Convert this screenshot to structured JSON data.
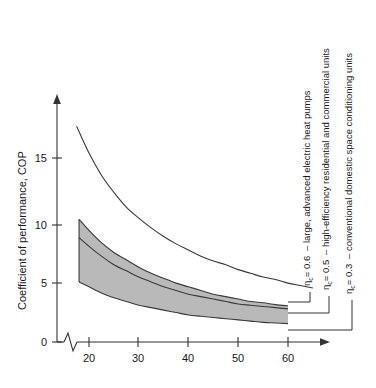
{
  "chart_data": {
    "type": "line",
    "title": "",
    "subtitle": "",
    "xlabel": "",
    "ylabel": "Coefficient of performance, COP",
    "xlim": [
      15,
      65
    ],
    "ylim": [
      0,
      18
    ],
    "xticks": [
      20,
      30,
      40,
      50,
      60
    ],
    "yticks": [
      0,
      5,
      10,
      15
    ],
    "xtick_labels": [
      "20",
      "30",
      "40",
      "50",
      "60"
    ],
    "ytick_labels": [
      "0",
      "5",
      "10",
      "15"
    ],
    "grid": false,
    "axis_break_x": true,
    "legend_position": "right-inline-annotations",
    "shaded_band": {
      "between": [
        "eta_0.5",
        "eta_0.3"
      ],
      "fill_color": "#b9b9b9",
      "x_start": 18,
      "x_end": 60
    },
    "series": [
      {
        "name": "eta_0.6",
        "eta_label": "0.6",
        "annotation": "– large, advanced electric heat pumps",
        "x": [
          17.5,
          20,
          22.5,
          25,
          27.5,
          30,
          32.5,
          35,
          37.5,
          40,
          42.5,
          45,
          47.5,
          50,
          52.5,
          55,
          57.5,
          60,
          62.5,
          65
        ],
        "y": [
          17.6,
          15.4,
          13.6,
          12.2,
          11.0,
          10.1,
          9.3,
          8.6,
          8.0,
          7.5,
          7.0,
          6.6,
          6.3,
          5.9,
          5.6,
          5.3,
          5.1,
          4.8,
          4.6,
          4.4
        ]
      },
      {
        "name": "eta_0.5",
        "eta_label": "0.5",
        "annotation": "– high-efficiency residential and commercial units",
        "x": [
          18,
          20,
          22.5,
          25,
          27.5,
          30,
          32.5,
          35,
          37.5,
          40,
          42.5,
          45,
          47.5,
          50,
          52.5,
          55,
          57.5,
          60
        ],
        "y": [
          8.5,
          7.8,
          7.0,
          6.3,
          5.8,
          5.3,
          4.9,
          4.5,
          4.2,
          3.9,
          3.7,
          3.5,
          3.3,
          3.1,
          3.0,
          2.9,
          2.8,
          2.7
        ]
      },
      {
        "name": "eta_0.3",
        "eta_label": "0.3",
        "annotation": "– conventional domestic space conditioning units",
        "x": [
          18,
          20,
          22.5,
          25,
          27.5,
          30,
          32.5,
          35,
          37.5,
          40,
          42.5,
          45,
          47.5,
          50,
          52.5,
          55,
          57.5,
          60
        ],
        "y": [
          4.9,
          4.5,
          4.0,
          3.6,
          3.3,
          3.0,
          2.8,
          2.6,
          2.4,
          2.2,
          2.1,
          2.0,
          1.9,
          1.8,
          1.7,
          1.6,
          1.55,
          1.5
        ]
      },
      {
        "name": "eta_0.5_band_upper",
        "eta_label": "",
        "annotation": "",
        "x": [
          18,
          20,
          22.5,
          25,
          27.5,
          30,
          32.5,
          35,
          37.5,
          40,
          42.5,
          45,
          47.5,
          50,
          52.5,
          55,
          57.5,
          60
        ],
        "y": [
          10.0,
          9.1,
          8.1,
          7.3,
          6.7,
          6.1,
          5.6,
          5.2,
          4.8,
          4.5,
          4.2,
          3.9,
          3.7,
          3.5,
          3.3,
          3.2,
          3.05,
          2.95
        ]
      }
    ]
  },
  "annotations": [
    {
      "eta_symbol": "η",
      "eta_subscript": "c",
      "equals_value": "= 0.6",
      "description": "– large, advanced electric heat pumps"
    },
    {
      "eta_symbol": "η",
      "eta_subscript": "c",
      "equals_value": "= 0.5",
      "description": "– high-efficiency residential and commercial units"
    },
    {
      "eta_symbol": "η",
      "eta_subscript": "c",
      "equals_value": "= 0.3",
      "description": "– conventional domestic space conditioning units"
    }
  ],
  "axes": {
    "y_title": "Coefficient of performance, COP",
    "y_tick_0": "0",
    "y_tick_5": "5",
    "y_tick_10": "10",
    "y_tick_15": "15",
    "x_tick_20": "20",
    "x_tick_30": "30",
    "x_tick_40": "40",
    "x_tick_50": "50",
    "x_tick_60": "60"
  },
  "colors": {
    "band_fill": "#b9b9b9",
    "curve_stroke": "#3a3a3a",
    "axis": "#333333",
    "text": "#1a1a1a",
    "background": "#ffffff"
  }
}
